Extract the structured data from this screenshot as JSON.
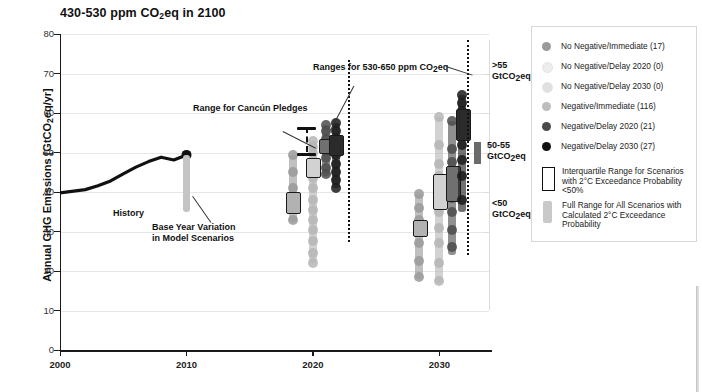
{
  "chart_data": {
    "type": "scatter",
    "ylabel": "Annual GHG Emissions [GtCO₂eq/yr]",
    "xlabel": "",
    "ylim": [
      0,
      80
    ],
    "xlim": [
      2000,
      2034
    ],
    "yticks": [
      0,
      10,
      20,
      30,
      40,
      50,
      60,
      70,
      80
    ],
    "xticks": [
      2000,
      2010,
      2020,
      2030
    ],
    "grid": true,
    "legend_position": "right",
    "series": [
      {
        "name": "No Negative/Immediate",
        "count": 17,
        "color": "#9a9a9a"
      },
      {
        "name": "No Negative/Delay 2020",
        "count": 0,
        "color": "#e2e2e2"
      },
      {
        "name": "No Negative/Delay 2030",
        "count": 0,
        "color": "#d6d6d6"
      },
      {
        "name": "Negative/Immediate",
        "count": 116,
        "color": "#b6b6b6"
      },
      {
        "name": "Negative/Delay 2020",
        "count": 21,
        "color": "#4c4c4c"
      },
      {
        "name": "Negative/Delay 2030",
        "count": 27,
        "color": "#1a1a1a"
      }
    ],
    "history_line": {
      "label": "History",
      "points": [
        {
          "year": 2000,
          "value": 39.8
        },
        {
          "year": 2002,
          "value": 40.6
        },
        {
          "year": 2003,
          "value": 41.6
        },
        {
          "year": 2004,
          "value": 42.8
        },
        {
          "year": 2005,
          "value": 44.6
        },
        {
          "year": 2006,
          "value": 46.3
        },
        {
          "year": 2007,
          "value": 47.7
        },
        {
          "year": 2008,
          "value": 48.8
        },
        {
          "year": 2009,
          "value": 48.1
        },
        {
          "year": 2010,
          "value": 49.4
        }
      ],
      "endpoint_marker": {
        "year": 2010,
        "value": 49.4
      }
    },
    "base_year_variation": {
      "year": 2010,
      "low": 35.0,
      "high": 49.4
    },
    "cancun_pledges": {
      "year": 2020,
      "low": 50.0,
      "high": 56.5
    },
    "clusters": [
      {
        "year": 2020,
        "groups": [
          {
            "series": "No Negative/Immediate",
            "full_range": [
              32.5,
              49.5
            ],
            "iqr": [
              35.0,
              40.0
            ],
            "points": [
              49.5,
              45.0,
              41.0,
              38.5,
              36.0,
              33.0
            ]
          },
          {
            "series": "Negative/Immediate",
            "full_range": [
              22.0,
              53.0
            ],
            "iqr": [
              44.0,
              48.5
            ],
            "points": [
              53.0,
              51.5,
              50.0,
              48.0,
              45.5,
              43.5,
              41.0,
              38.0,
              35.5,
              33.0,
              30.5,
              27.5,
              24.5,
              22.0
            ]
          },
          {
            "series": "Negative/Delay 2020",
            "full_range": [
              44.0,
              57.0
            ],
            "iqr": [
              50.0,
              53.5
            ],
            "points": [
              57.0,
              55.5,
              53.5,
              52.0,
              50.5,
              48.5,
              46.0,
              44.5
            ]
          },
          {
            "series": "Negative/Delay 2030",
            "full_range": [
              41.0,
              57.5
            ],
            "iqr": [
              49.5,
              54.5
            ],
            "points": [
              57.5,
              55.5,
              53.5,
              51.5,
              49.5,
              47.0,
              45.0,
              43.0,
              41.0
            ]
          }
        ]
      },
      {
        "year": 2030,
        "groups": [
          {
            "series": "No Negative/Immediate",
            "full_range": [
              18.0,
              39.5
            ],
            "iqr": [
              29.0,
              33.0
            ],
            "points": [
              39.5,
              36.0,
              33.0,
              30.5,
              27.0,
              22.5,
              18.5
            ]
          },
          {
            "series": "Negative/Immediate",
            "full_range": [
              17.0,
              59.0
            ],
            "iqr": [
              36.0,
              44.5
            ],
            "points": [
              59.0,
              52.0,
              47.0,
              44.0,
              41.0,
              38.0,
              35.0,
              31.0,
              27.0,
              22.0,
              17.5
            ]
          },
          {
            "series": "Negative/Delay 2020",
            "full_range": [
              24.0,
              58.0
            ],
            "iqr": [
              38.0,
              46.5
            ],
            "points": [
              58.0,
              51.0,
              47.5,
              45.0,
              42.0,
              38.5,
              35.0,
              30.5,
              26.0
            ]
          },
          {
            "series": "Negative/Delay 2030",
            "full_range": [
              35.0,
              64.5
            ],
            "iqr": [
              53.5,
              61.0
            ],
            "points": [
              64.5,
              62.5,
              60.5,
              58.5,
              56.5,
              54.5,
              52.0,
              48.0,
              44.0,
              38.0
            ]
          }
        ]
      }
    ],
    "annotations": [
      {
        "name": "cancun-pledges",
        "text": "Range for Cancún Pledges"
      },
      {
        "name": "ranges-530-650",
        "text": "Ranges for 530-650 ppm CO₂eq"
      },
      {
        "name": "base-year-variation",
        "text": "Base Year Variation\nin Model Scenarios"
      }
    ]
  },
  "axes": {
    "ylabel_pre": "Annual GHG Emissions [GtCO",
    "ylabel_sub": "2",
    "ylabel_post": "eq/yr]",
    "yticks": [
      "80",
      "70",
      "60",
      "50",
      "40",
      "30",
      "20",
      "10",
      "0"
    ],
    "xticks": [
      "2000",
      "2010",
      "2020",
      "2030"
    ]
  },
  "annotations": {
    "history": "History",
    "cancun": "Range for Cancún Pledges",
    "ranges_pre": "Ranges for 530-650 ppm CO",
    "ranges_sub": "2",
    "ranges_post": "eq",
    "base_year_l1": "Base Year Variation",
    "base_year_l2": "in Model Scenarios"
  },
  "right_labels": [
    {
      "l1": ">55",
      "l2_pre": "GtCO",
      "l2_sub": "2",
      "l2_post": "eq"
    },
    {
      "l1": "50-55",
      "l2_pre": "GtCO",
      "l2_sub": "2",
      "l2_post": "eq"
    },
    {
      "l1": "<50",
      "l2_pre": "GtCO",
      "l2_sub": "2",
      "l2_post": "eq"
    }
  ],
  "legend": {
    "entries": [
      {
        "label": "No Negative/Immediate (17)",
        "color": "#9a9a9a"
      },
      {
        "label": "No Negative/Delay 2020 (0)",
        "color": "#ededed"
      },
      {
        "label": "No Negative/Delay 2030 (0)",
        "color": "#e0e0e0"
      },
      {
        "label": "Negative/Immediate (116)",
        "color": "#bdbdbd"
      },
      {
        "label": "Negative/Delay 2020 (21)",
        "color": "#4a4a4a"
      },
      {
        "label": "Negative/Delay 2030 (27)",
        "color": "#111111"
      }
    ],
    "iqr_l1": "Interquartile Range for Scenarios",
    "iqr_l2": "with 2°C Exceedance Probability",
    "iqr_l3": "<50%",
    "full_l1": "Full Range for All Scenarios with",
    "full_l2": "Calculated 2°C Exceedance",
    "full_l3": "Probability"
  }
}
